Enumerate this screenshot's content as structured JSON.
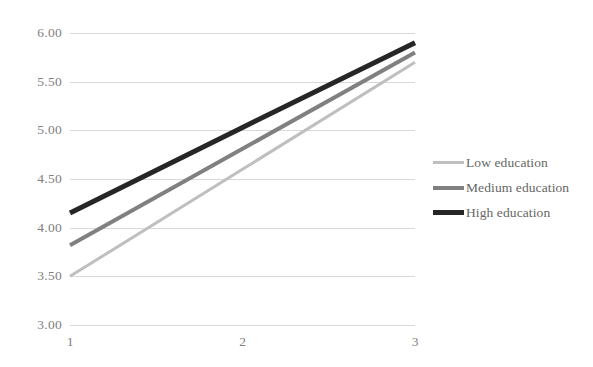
{
  "chart_data": {
    "type": "line",
    "title": "",
    "subtitle": "",
    "xlabel": "",
    "ylabel": "",
    "x": [
      1,
      2,
      3
    ],
    "categories": [
      "1",
      "2",
      "3"
    ],
    "xtick_labels": [
      "1",
      "2",
      "3"
    ],
    "ytick_labels": [
      "6.00",
      "5.50",
      "5.00",
      "4.50",
      "4.00",
      "3.50",
      "3.00"
    ],
    "ytick_values": [
      6.0,
      5.5,
      5.0,
      4.5,
      4.0,
      3.5,
      3.0
    ],
    "ylim": [
      3.0,
      6.0
    ],
    "xlim": [
      1,
      3
    ],
    "grid": "horizontal",
    "legend_position": "right",
    "series": [
      {
        "name": "Low education",
        "values": [
          3.5,
          4.6,
          5.7
        ],
        "color": "#bfbfbf",
        "width": 3
      },
      {
        "name": "Medium education",
        "values": [
          3.82,
          4.81,
          5.8
        ],
        "color": "#808080",
        "width": 4
      },
      {
        "name": "High education",
        "values": [
          4.15,
          5.03,
          5.9
        ],
        "color": "#262626",
        "width": 5
      }
    ],
    "annotations": []
  },
  "legend": {
    "items": [
      {
        "label": "Low education"
      },
      {
        "label": "Medium education"
      },
      {
        "label": "High education"
      }
    ]
  },
  "colors": {
    "gridline": "#d9d9d9",
    "axis_text": "#808080",
    "legend_text": "#666666",
    "background": "#ffffff"
  }
}
